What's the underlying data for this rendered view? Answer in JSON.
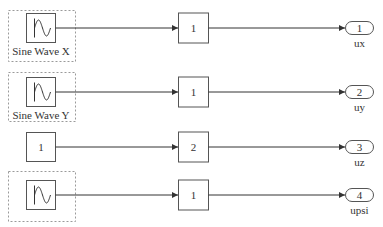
{
  "diagram": {
    "rows": [
      {
        "source": {
          "type": "sine",
          "label": "Sine Wave X",
          "icon": "sine-wave-icon",
          "grouped": true
        },
        "gain": {
          "value": "1"
        },
        "outport": {
          "number": "1",
          "name": "ux"
        }
      },
      {
        "source": {
          "type": "sine",
          "label": "Sine Wave Y",
          "icon": "sine-wave-icon",
          "grouped": true
        },
        "gain": {
          "value": "1"
        },
        "outport": {
          "number": "2",
          "name": "uy"
        }
      },
      {
        "source": {
          "type": "constant",
          "value": "1",
          "grouped": false
        },
        "gain": {
          "value": "2"
        },
        "outport": {
          "number": "3",
          "name": "uz"
        }
      },
      {
        "source": {
          "type": "sine",
          "label": "",
          "icon": "sine-wave-icon",
          "grouped": true
        },
        "gain": {
          "value": "1"
        },
        "outport": {
          "number": "4",
          "name": "upsi"
        }
      }
    ]
  },
  "colors": {
    "block_stroke": "#555555",
    "wire": "#333333",
    "dashed_group": "#9a9a9a",
    "background": "#ffffff"
  }
}
